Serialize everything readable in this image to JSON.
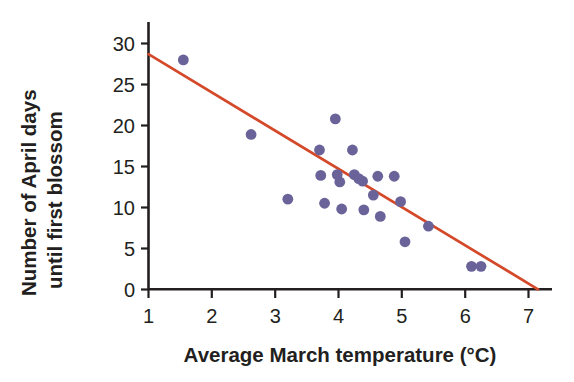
{
  "chart_data": {
    "type": "scatter",
    "title": "",
    "xlabel": "Average March temperature (°C)",
    "ylabel": "Number of April days until first blossom",
    "ylabel_line1": "Number of April days",
    "ylabel_line2": "until first blossom",
    "xlim": [
      1,
      7.25
    ],
    "ylim": [
      0,
      31
    ],
    "xticks": [
      1,
      2,
      3,
      4,
      5,
      6,
      7
    ],
    "xtick_labels": [
      "1",
      "2",
      "3",
      "4",
      "5",
      "6",
      "7"
    ],
    "yticks": [
      0,
      5,
      10,
      15,
      20,
      25,
      30
    ],
    "ytick_labels": [
      "0",
      "5",
      "10",
      "15",
      "20",
      "25",
      "30"
    ],
    "grid": false,
    "legend": false,
    "marker_color": "#6a6399",
    "trendline_color": "#d4492a",
    "axis_color": "#231f20",
    "points": [
      {
        "x": 1.55,
        "y": 28.0
      },
      {
        "x": 2.62,
        "y": 18.9
      },
      {
        "x": 3.2,
        "y": 11.0
      },
      {
        "x": 3.7,
        "y": 17.0
      },
      {
        "x": 3.72,
        "y": 13.9
      },
      {
        "x": 3.78,
        "y": 10.5
      },
      {
        "x": 3.95,
        "y": 20.8
      },
      {
        "x": 3.98,
        "y": 14.0
      },
      {
        "x": 4.02,
        "y": 13.1
      },
      {
        "x": 4.05,
        "y": 9.8
      },
      {
        "x": 4.22,
        "y": 17.0
      },
      {
        "x": 4.25,
        "y": 14.0
      },
      {
        "x": 4.32,
        "y": 13.5
      },
      {
        "x": 4.38,
        "y": 13.2
      },
      {
        "x": 4.4,
        "y": 9.7
      },
      {
        "x": 4.55,
        "y": 11.5
      },
      {
        "x": 4.62,
        "y": 13.8
      },
      {
        "x": 4.66,
        "y": 8.9
      },
      {
        "x": 4.88,
        "y": 13.8
      },
      {
        "x": 4.98,
        "y": 10.7
      },
      {
        "x": 5.05,
        "y": 5.8
      },
      {
        "x": 5.42,
        "y": 7.7
      },
      {
        "x": 6.1,
        "y": 2.8
      },
      {
        "x": 6.25,
        "y": 2.8
      }
    ],
    "trendline": {
      "x_start": 1.0,
      "y_start": 28.7,
      "x_end": 7.15,
      "y_end": 0.0
    }
  }
}
